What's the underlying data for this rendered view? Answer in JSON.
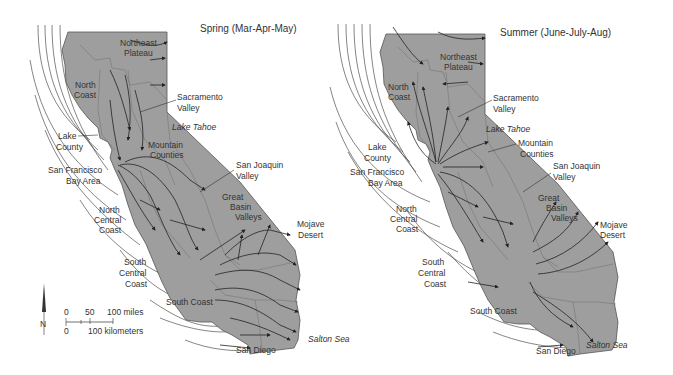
{
  "panels": [
    {
      "title": "Spring (Mar-Apr-May)",
      "labels": {
        "northeast_plateau": [
          "Northeast",
          "Plateau"
        ],
        "north_coast": [
          "North",
          "Coast"
        ],
        "sacramento_valley": [
          "Sacramento",
          "Valley"
        ],
        "lake_tahoe": "Lake Tahoe",
        "lake_county": [
          "Lake",
          "County"
        ],
        "mountain_counties": [
          "Mountain",
          "Counties"
        ],
        "san_francisco_bay_area": [
          "San Francisco",
          "Bay Area"
        ],
        "san_joaquin_valley": [
          "San Joaquin",
          "Valley"
        ],
        "great_basin_valleys": [
          "Great",
          "Basin",
          "Valleys"
        ],
        "north_central_coast": [
          "North",
          "Central",
          "Coast"
        ],
        "mojave_desert": [
          "Mojave",
          "Desert"
        ],
        "south_central_coast": [
          "South",
          "Central",
          "Coast"
        ],
        "south_coast": "South Coast",
        "san_diego": "San Diego",
        "salton_sea": "Salton Sea"
      }
    },
    {
      "title": "Summer (June-July-Aug)",
      "labels": {
        "northeast_plateau": [
          "Northeast",
          "Plateau"
        ],
        "north_coast": [
          "North",
          "Coast"
        ],
        "sacramento_valley": [
          "Sacramento",
          "Valley"
        ],
        "lake_tahoe": "Lake Tahoe",
        "lake_county": [
          "Lake",
          "County"
        ],
        "mountain_counties": [
          "Mountain",
          "Counties"
        ],
        "san_francisco_bay_area": [
          "San Francisco",
          "Bay Area"
        ],
        "san_joaquin_valley": [
          "San Joaquin",
          "Valley"
        ],
        "great_basin_valleys": [
          "Great",
          "Basin",
          "Valleys"
        ],
        "north_central_coast": [
          "North",
          "Central",
          "Coast"
        ],
        "mojave_desert": [
          "Mojave",
          "Desert"
        ],
        "south_central_coast": [
          "South",
          "Central",
          "Coast"
        ],
        "south_coast": "South Coast",
        "san_diego": "San Diego",
        "salton_sea": "Salton Sea"
      }
    }
  ],
  "scale": {
    "miles_ticks": [
      "0",
      "50",
      "100 miles"
    ],
    "km_ticks": [
      "0",
      "100 kilometers"
    ],
    "north": "N"
  },
  "colors": {
    "land": "#9e9e9e",
    "lines": "#222222",
    "text": "#333333"
  }
}
